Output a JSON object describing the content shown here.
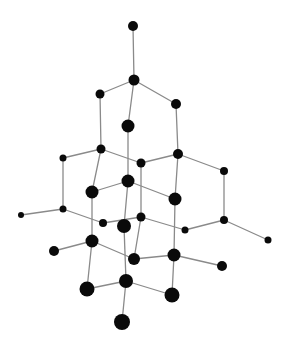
{
  "diagram": {
    "title": "Diamond cubic crystal lattice",
    "colors": {
      "background": "#ffffff",
      "atom": "#0a0a0a",
      "bond": "#8a8a8a"
    },
    "atoms": [
      {
        "id": "a0",
        "x": 133,
        "y": 26,
        "r": 5.0
      },
      {
        "id": "a1",
        "x": 134,
        "y": 80,
        "r": 5.5
      },
      {
        "id": "a2",
        "x": 100,
        "y": 94,
        "r": 4.5
      },
      {
        "id": "a3",
        "x": 176,
        "y": 104,
        "r": 5.0
      },
      {
        "id": "a4",
        "x": 128,
        "y": 126,
        "r": 6.5
      },
      {
        "id": "a5",
        "x": 101,
        "y": 149,
        "r": 4.5
      },
      {
        "id": "a6",
        "x": 63,
        "y": 158,
        "r": 3.5
      },
      {
        "id": "a7",
        "x": 141,
        "y": 163,
        "r": 4.5
      },
      {
        "id": "a8",
        "x": 178,
        "y": 154,
        "r": 5.0
      },
      {
        "id": "a9",
        "x": 224,
        "y": 171,
        "r": 4.0
      },
      {
        "id": "a10",
        "x": 128,
        "y": 181,
        "r": 6.5
      },
      {
        "id": "a11",
        "x": 92,
        "y": 192,
        "r": 6.5
      },
      {
        "id": "a12",
        "x": 175,
        "y": 199,
        "r": 6.5
      },
      {
        "id": "a13",
        "x": 63,
        "y": 209,
        "r": 3.5
      },
      {
        "id": "a14",
        "x": 21,
        "y": 215,
        "r": 3.0
      },
      {
        "id": "a15",
        "x": 103,
        "y": 223,
        "r": 4.0
      },
      {
        "id": "a16",
        "x": 124,
        "y": 226,
        "r": 7.0
      },
      {
        "id": "a17",
        "x": 141,
        "y": 217,
        "r": 4.5
      },
      {
        "id": "a18",
        "x": 185,
        "y": 230,
        "r": 3.5
      },
      {
        "id": "a19",
        "x": 224,
        "y": 220,
        "r": 4.0
      },
      {
        "id": "a20",
        "x": 268,
        "y": 240,
        "r": 3.5
      },
      {
        "id": "a21",
        "x": 92,
        "y": 241,
        "r": 6.5
      },
      {
        "id": "a22",
        "x": 54,
        "y": 251,
        "r": 5.0
      },
      {
        "id": "a23",
        "x": 134,
        "y": 259,
        "r": 6.0
      },
      {
        "id": "a24",
        "x": 174,
        "y": 255,
        "r": 6.5
      },
      {
        "id": "a25",
        "x": 222,
        "y": 266,
        "r": 5.0
      },
      {
        "id": "a26",
        "x": 126,
        "y": 281,
        "r": 7.0
      },
      {
        "id": "a27",
        "x": 87,
        "y": 289,
        "r": 7.5
      },
      {
        "id": "a28",
        "x": 172,
        "y": 295,
        "r": 7.5
      },
      {
        "id": "a29",
        "x": 122,
        "y": 322,
        "r": 8.0
      }
    ],
    "bonds": [
      [
        "a0",
        "a1"
      ],
      [
        "a1",
        "a2"
      ],
      [
        "a1",
        "a3"
      ],
      [
        "a1",
        "a4"
      ],
      [
        "a2",
        "a5"
      ],
      [
        "a3",
        "a8"
      ],
      [
        "a4",
        "a10"
      ],
      [
        "a6",
        "a5"
      ],
      [
        "a5",
        "a7"
      ],
      [
        "a7",
        "a8"
      ],
      [
        "a8",
        "a9"
      ],
      [
        "a5",
        "a11"
      ],
      [
        "a6",
        "a13"
      ],
      [
        "a7",
        "a17"
      ],
      [
        "a8",
        "a12"
      ],
      [
        "a11",
        "a10"
      ],
      [
        "a10",
        "a12"
      ],
      [
        "a10",
        "a16"
      ],
      [
        "a9",
        "a19"
      ],
      [
        "a11",
        "a21"
      ],
      [
        "a12",
        "a24"
      ],
      [
        "a14",
        "a13"
      ],
      [
        "a13",
        "a15"
      ],
      [
        "a15",
        "a17"
      ],
      [
        "a17",
        "a18"
      ],
      [
        "a18",
        "a19"
      ],
      [
        "a19",
        "a20"
      ],
      [
        "a22",
        "a21"
      ],
      [
        "a21",
        "a23"
      ],
      [
        "a17",
        "a23"
      ],
      [
        "a23",
        "a24"
      ],
      [
        "a24",
        "a25"
      ],
      [
        "a16",
        "a26"
      ],
      [
        "a21",
        "a27"
      ],
      [
        "a27",
        "a26"
      ],
      [
        "a26",
        "a28"
      ],
      [
        "a24",
        "a28"
      ],
      [
        "a26",
        "a29"
      ]
    ]
  }
}
